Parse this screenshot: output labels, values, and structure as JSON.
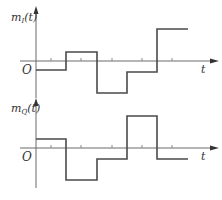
{
  "diagram": {
    "type": "waveform",
    "colors": {
      "axis": "#6a6a6a",
      "wave": "#4a4a4a",
      "text": "#333333"
    },
    "panels": [
      {
        "id": "inphase",
        "ylabel_main": "m",
        "ylabel_sub": "I",
        "ylabel_arg": "(t)",
        "origin_label": "O",
        "xlabel": "t",
        "levels": [
          -1,
          1,
          -3,
          -1,
          3
        ]
      },
      {
        "id": "quadrature",
        "ylabel_main": "m",
        "ylabel_sub": "Q",
        "ylabel_arg": "(t)",
        "origin_label": "O",
        "xlabel": "t",
        "levels": [
          1,
          -3,
          -1,
          3,
          -1
        ]
      }
    ]
  }
}
